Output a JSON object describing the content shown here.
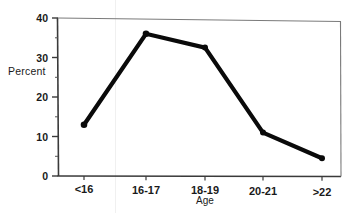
{
  "chart_data": {
    "type": "line",
    "title": "",
    "subtitle": "",
    "xlabel": "Age",
    "ylabel": "Percent",
    "categories": [
      "<16",
      "16-17",
      "18-19",
      "20-21",
      ">22"
    ],
    "values": [
      13,
      36,
      32.5,
      11,
      4.5
    ],
    "series": [
      {
        "name": "Percent",
        "values": [
          13,
          36,
          32.5,
          11,
          4.5
        ]
      }
    ],
    "ylim": [
      0,
      40
    ],
    "yticks": [
      0,
      10,
      20,
      30,
      40
    ],
    "ytick_labels": [
      "0",
      "10",
      "20",
      "30",
      "40"
    ],
    "yminor_ticks": [
      5,
      15,
      25,
      35
    ],
    "xtick_labels": [
      "<16",
      "16-17",
      "18-19",
      "20-21",
      ">22"
    ],
    "grid": false,
    "legend": false,
    "legend_position": "none",
    "marker": "filled-circle",
    "line_color": "#000000",
    "marker_color": "#000000",
    "axis_color": "#333333",
    "background_color": "#ffffff",
    "annotations": []
  },
  "axes": {
    "y_title": "Percent",
    "x_title": "Age"
  },
  "y_ticks": [
    {
      "label": "40",
      "value": 40
    },
    {
      "label": "30",
      "value": 30
    },
    {
      "label": "20",
      "value": 20
    },
    {
      "label": "10",
      "value": 10
    },
    {
      "label": "0",
      "value": 0
    }
  ],
  "x_ticks": [
    {
      "label": "<16",
      "value": 13
    },
    {
      "label": "16-17",
      "value": 36
    },
    {
      "label": "18-19",
      "value": 32.5
    },
    {
      "label": "20-21",
      "value": 11
    },
    {
      "label": ">22",
      "value": 4.5
    }
  ]
}
